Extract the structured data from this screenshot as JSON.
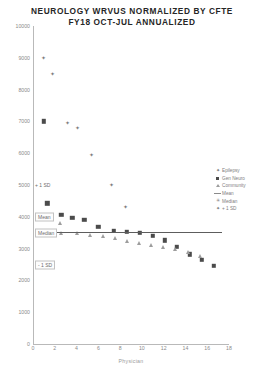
{
  "title": {
    "line1": "NEUROLOGY WRVUS NORMALIZED BY CFTE",
    "line2": "FY18 OCT-JUL ANNUALIZED"
  },
  "legend": {
    "items": [
      {
        "label": "Epilepsy",
        "marker": "plus-icon"
      },
      {
        "label": "Gen Neuro",
        "marker": "square-icon"
      },
      {
        "label": "Community",
        "marker": "triangle-icon"
      },
      {
        "label": "Mean",
        "marker": "line-icon"
      },
      {
        "label": "Median",
        "marker": "star-icon"
      },
      {
        "label": "+ 1 SD",
        "marker": "plus-icon"
      }
    ]
  },
  "annotations": [
    {
      "text": "+ 1 SD",
      "value": 5000,
      "boxed": false
    },
    {
      "text": "Mean",
      "value": 4000,
      "boxed": true
    },
    {
      "text": "Median",
      "value": 3500,
      "boxed": true
    },
    {
      "text": "- 1 SD",
      "value": 2500,
      "boxed": true
    }
  ],
  "chart_data": {
    "type": "scatter",
    "title": "NEUROLOGY WRVUS NORMALIZED BY CFTE FY18 OCT-JUL ANNUALIZED",
    "xlabel": "Physician",
    "ylabel": "",
    "xlim": [
      0,
      18
    ],
    "ylim": [
      0,
      10000
    ],
    "ytick_labels": [
      "0",
      "1000",
      "2000",
      "3000",
      "4000",
      "5000",
      "6000",
      "7000",
      "8000",
      "9000",
      "10000"
    ],
    "ytick_values": [
      0,
      1000,
      2000,
      3000,
      4000,
      5000,
      6000,
      7000,
      8000,
      9000,
      10000
    ],
    "xtick_labels": [
      "0",
      "2",
      "4",
      "6",
      "8",
      "10",
      "12",
      "14",
      "16",
      "18"
    ],
    "xtick_values": [
      0,
      2,
      4,
      6,
      8,
      10,
      12,
      14,
      16,
      18
    ],
    "grid": false,
    "legend_position": "right",
    "reference_lines": [
      {
        "name": "Mean",
        "y": 3520,
        "x_start": 1.0,
        "x_end": 17.4
      }
    ],
    "series": [
      {
        "name": "Epilepsy",
        "marker": "plus",
        "points": [
          {
            "x": 1.0,
            "y": 9000
          },
          {
            "x": 1.8,
            "y": 8500
          },
          {
            "x": 3.2,
            "y": 6950
          },
          {
            "x": 4.1,
            "y": 6800
          },
          {
            "x": 5.4,
            "y": 5950
          },
          {
            "x": 7.2,
            "y": 5000
          },
          {
            "x": 8.5,
            "y": 4300
          }
        ]
      },
      {
        "name": "Gen Neuro",
        "marker": "square",
        "points": [
          {
            "x": 1.0,
            "y": 7000
          },
          {
            "x": 1.3,
            "y": 4420
          },
          {
            "x": 2.6,
            "y": 4060
          },
          {
            "x": 3.6,
            "y": 3960
          },
          {
            "x": 4.7,
            "y": 3900
          },
          {
            "x": 6.0,
            "y": 3680
          },
          {
            "x": 7.4,
            "y": 3560
          },
          {
            "x": 8.6,
            "y": 3520
          },
          {
            "x": 9.8,
            "y": 3500
          },
          {
            "x": 11.0,
            "y": 3400
          },
          {
            "x": 12.1,
            "y": 3260
          },
          {
            "x": 13.2,
            "y": 3060
          },
          {
            "x": 14.4,
            "y": 2820
          },
          {
            "x": 15.5,
            "y": 2640
          },
          {
            "x": 16.6,
            "y": 2450
          }
        ]
      },
      {
        "name": "Community",
        "marker": "triangle",
        "points": [
          {
            "x": 1.0,
            "y": 3960
          },
          {
            "x": 1.0,
            "y": 3520
          },
          {
            "x": 2.5,
            "y": 3800
          },
          {
            "x": 2.6,
            "y": 3480
          },
          {
            "x": 4.0,
            "y": 3500
          },
          {
            "x": 5.2,
            "y": 3440
          },
          {
            "x": 6.4,
            "y": 3400
          },
          {
            "x": 7.5,
            "y": 3320
          },
          {
            "x": 8.6,
            "y": 3240
          },
          {
            "x": 9.7,
            "y": 3180
          },
          {
            "x": 10.8,
            "y": 3120
          },
          {
            "x": 11.9,
            "y": 3060
          },
          {
            "x": 13.0,
            "y": 3000
          },
          {
            "x": 14.2,
            "y": 2880
          },
          {
            "x": 15.3,
            "y": 2760
          }
        ]
      },
      {
        "name": "Median",
        "marker": "star",
        "points": [
          {
            "x": 1.0,
            "y": 3520
          }
        ]
      }
    ]
  },
  "xaxis_title": "Physician"
}
